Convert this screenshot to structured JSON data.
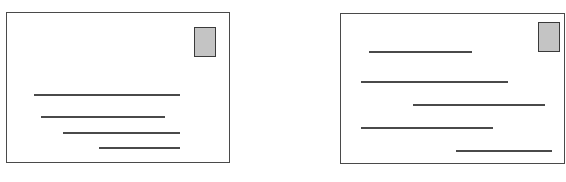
{
  "figure": {
    "colors": {
      "border": "#4a4a4a",
      "stamp_fill": "#c4c4c4",
      "stamp_border": "#3a3a3a",
      "background": "#ffffff"
    },
    "cards": [
      {
        "name": "left-card",
        "box": {
          "x": 6,
          "y": 12,
          "w": 224,
          "h": 151
        },
        "stamp": {
          "x": 194,
          "y": 27,
          "w": 22,
          "h": 30
        },
        "lines": [
          {
            "x1": 34,
            "x2": 180,
            "y": 94
          },
          {
            "x1": 41,
            "x2": 165,
            "y": 116
          },
          {
            "x1": 63,
            "x2": 180,
            "y": 132
          },
          {
            "x1": 99,
            "x2": 180,
            "y": 147
          }
        ]
      },
      {
        "name": "right-card",
        "box": {
          "x": 340,
          "y": 13,
          "w": 225,
          "h": 151
        },
        "stamp": {
          "x": 538,
          "y": 22,
          "w": 22,
          "h": 30
        },
        "lines": [
          {
            "x1": 369,
            "x2": 472,
            "y": 51
          },
          {
            "x1": 361,
            "x2": 508,
            "y": 81
          },
          {
            "x1": 413,
            "x2": 545,
            "y": 104
          },
          {
            "x1": 361,
            "x2": 493,
            "y": 127
          },
          {
            "x1": 456,
            "x2": 552,
            "y": 150
          }
        ]
      }
    ]
  }
}
